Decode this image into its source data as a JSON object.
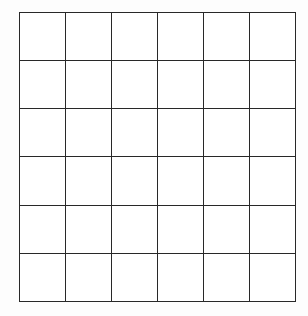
{
  "figure": {
    "name": "blank-grid",
    "kind": "line-drawing",
    "rows": 6,
    "columns": 6,
    "total_cells": 36,
    "caption": "",
    "colors": {
      "background": "#fdfdfd",
      "cell_fill": "#ffffff",
      "line": "#2b2b2b"
    },
    "geometry": {
      "left": 19,
      "top": 12,
      "width": 277,
      "height": 290,
      "column_width": 46.2,
      "row_height": 48.3,
      "line_width": 2.5,
      "vertical_lines_x": [
        19,
        64,
        110,
        156,
        202,
        249,
        296
      ],
      "horizontal_lines_y": [
        12,
        60,
        108,
        156,
        205,
        253,
        302
      ]
    },
    "cells": [
      [
        "",
        "",
        "",
        "",
        "",
        ""
      ],
      [
        "",
        "",
        "",
        "",
        "",
        ""
      ],
      [
        "",
        "",
        "",
        "",
        "",
        ""
      ],
      [
        "",
        "",
        "",
        "",
        "",
        ""
      ],
      [
        "",
        "",
        "",
        "",
        "",
        ""
      ],
      [
        "",
        "",
        "",
        "",
        "",
        ""
      ]
    ]
  }
}
